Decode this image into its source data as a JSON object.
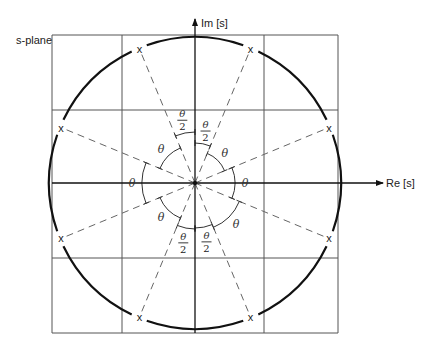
{
  "diagram": {
    "title_label": "s-plane",
    "imag_axis_label": "Im [s]",
    "real_axis_label": "Re [s]",
    "pole_marker": "x",
    "angle_symbol": "θ",
    "half_angle_numerator": "θ",
    "half_angle_denominator": "2",
    "pole_count": 8,
    "pole_angles_deg": [
      22.5,
      67.5,
      112.5,
      157.5,
      202.5,
      247.5,
      292.5,
      337.5
    ],
    "angle_theta_deg": 45,
    "angle_labels": [
      {
        "kind": "half",
        "from_deg": 90,
        "to_deg": 112.5
      },
      {
        "kind": "half",
        "from_deg": 67.5,
        "to_deg": 90
      },
      {
        "kind": "full",
        "from_deg": 112.5,
        "to_deg": 157.5
      },
      {
        "kind": "full",
        "from_deg": 22.5,
        "to_deg": 67.5
      },
      {
        "kind": "full",
        "from_deg": 157.5,
        "to_deg": 202.5
      },
      {
        "kind": "full",
        "from_deg": -22.5,
        "to_deg": 22.5
      },
      {
        "kind": "full",
        "from_deg": 202.5,
        "to_deg": 247.5
      },
      {
        "kind": "full",
        "from_deg": 292.5,
        "to_deg": 337.5
      },
      {
        "kind": "half",
        "from_deg": 247.5,
        "to_deg": 270
      },
      {
        "kind": "half",
        "from_deg": 270,
        "to_deg": 292.5
      }
    ],
    "colors": {
      "grid": "#555555",
      "circle": "#111111",
      "rays": "#666666",
      "text": "#222222"
    }
  }
}
